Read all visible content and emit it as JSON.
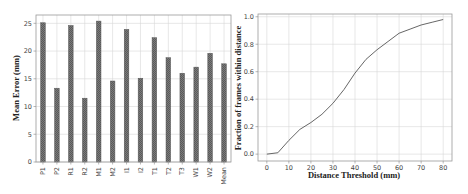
{
  "chart_data": [
    {
      "type": "bar",
      "title": "",
      "xlabel": "",
      "ylabel": "Mean Error (mm)",
      "ylim": [
        0,
        26.5
      ],
      "yticks": [
        0,
        5,
        10,
        15,
        20,
        25
      ],
      "grid": true,
      "legend": null,
      "categories": [
        "P1",
        "P2",
        "R1",
        "R2",
        "M1",
        "M2",
        "I1",
        "I2",
        "T1",
        "T2",
        "T3",
        "W1",
        "W2",
        "Mean"
      ],
      "values": [
        25.1,
        13.3,
        24.6,
        11.5,
        25.4,
        14.6,
        23.9,
        15.1,
        22.4,
        18.8,
        16.0,
        17.1,
        19.6,
        17.7
      ],
      "bar_color": "#6e6e6e"
    },
    {
      "type": "line",
      "title": "",
      "xlabel": "Distance Threshold (mm)",
      "ylabel": "Fraction of frames within distance",
      "xlim": [
        -4,
        84
      ],
      "ylim": [
        -0.05,
        1.02
      ],
      "xticks": [
        0,
        10,
        20,
        30,
        40,
        50,
        60,
        70,
        80
      ],
      "yticks": [
        0.0,
        0.2,
        0.4,
        0.6,
        0.8,
        1.0
      ],
      "grid": true,
      "legend": null,
      "x": [
        0,
        5,
        10,
        15,
        20,
        25,
        30,
        35,
        40,
        45,
        50,
        55,
        60,
        65,
        70,
        75,
        80
      ],
      "series": [
        {
          "name": "Fraction of frames",
          "values": [
            0.0,
            0.01,
            0.1,
            0.18,
            0.23,
            0.29,
            0.37,
            0.47,
            0.59,
            0.69,
            0.76,
            0.82,
            0.88,
            0.91,
            0.94,
            0.96,
            0.98
          ],
          "color": "#555555"
        }
      ]
    }
  ]
}
